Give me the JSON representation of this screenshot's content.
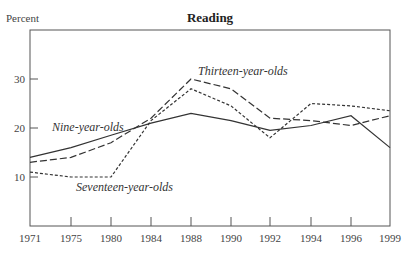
{
  "chart_data": {
    "type": "line",
    "title": "Reading",
    "xlabel": "",
    "ylabel": "Percent",
    "x": [
      1971,
      1975,
      1980,
      1984,
      1988,
      1990,
      1992,
      1994,
      1996,
      1999
    ],
    "x_tick_labels": [
      "1971",
      "1975",
      "1980",
      "1984",
      "1988",
      "1990",
      "1992",
      "1994",
      "1996",
      "1999"
    ],
    "y_ticks": [
      10,
      20,
      30
    ],
    "ylim": [
      0,
      40
    ],
    "grid": false,
    "legend_position": "inline labels",
    "series": [
      {
        "name": "Nine-year-olds",
        "style": "solid",
        "values": [
          14,
          16,
          18.5,
          21,
          23,
          21.5,
          19.5,
          20.5,
          22.5,
          16
        ]
      },
      {
        "name": "Thirteen-year-olds",
        "style": "long-dash",
        "values": [
          13,
          14,
          17,
          22,
          30,
          28,
          22,
          21.5,
          20.5,
          22.5
        ]
      },
      {
        "name": "Seventeen-year-olds",
        "style": "short-dash",
        "values": [
          11,
          10,
          10,
          21.5,
          28,
          24.5,
          18,
          25,
          24.5,
          23.5
        ]
      }
    ]
  },
  "labels": {
    "ylabel": "Percent",
    "title": "Reading",
    "nine": "Nine-year-olds",
    "thirteen": "Thirteen-year-olds",
    "seventeen": "Seventeen-year-olds"
  }
}
